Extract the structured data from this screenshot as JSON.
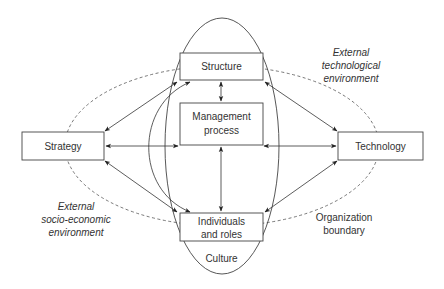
{
  "diagram": {
    "nodes": {
      "structure": "Structure",
      "management_line1": "Management",
      "management_line2": "process",
      "strategy": "Strategy",
      "technology": "Technology",
      "individuals_line1": "Individuals",
      "individuals_line2": "and roles"
    },
    "regions": {
      "culture": "Culture",
      "org_boundary_line1": "Organization",
      "org_boundary_line2": "boundary"
    },
    "external": {
      "tech_line1": "External",
      "tech_line2": "technological",
      "tech_line3": "environment",
      "socio_line1": "External",
      "socio_line2": "socio-economic",
      "socio_line3": "environment"
    },
    "edges": [
      {
        "from": "Structure",
        "to": "Management process",
        "type": "bidirectional"
      },
      {
        "from": "Management process",
        "to": "Individuals and roles",
        "type": "bidirectional"
      },
      {
        "from": "Strategy",
        "to": "Management process",
        "type": "bidirectional"
      },
      {
        "from": "Technology",
        "to": "Management process",
        "type": "bidirectional"
      },
      {
        "from": "Strategy",
        "to": "Structure",
        "type": "bidirectional"
      },
      {
        "from": "Strategy",
        "to": "Individuals and roles",
        "type": "bidirectional"
      },
      {
        "from": "Technology",
        "to": "Structure",
        "type": "bidirectional"
      },
      {
        "from": "Technology",
        "to": "Individuals and roles",
        "type": "bidirectional"
      },
      {
        "from": "Structure",
        "to": "Individuals and roles",
        "type": "bidirectional-curved"
      }
    ]
  }
}
